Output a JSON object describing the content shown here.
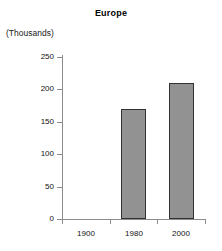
{
  "chart_data": {
    "type": "bar",
    "title": "Europe",
    "xlabel": "",
    "ylabel": "(Thousands)",
    "categories": [
      "1900",
      "1980",
      "2000"
    ],
    "values": [
      0,
      170,
      210
    ],
    "series": [
      {
        "name": "Europe",
        "values": [
          0,
          170,
          210
        ]
      }
    ],
    "ylim": [
      0,
      250
    ],
    "yticks": [
      0,
      50,
      100,
      150,
      200,
      250
    ],
    "ytick_labels": [
      "0",
      "50",
      "100",
      "150",
      "200",
      "250"
    ],
    "grid": false,
    "legend": false,
    "bar_fill_color": "#929292",
    "bar_border_color": "#333333",
    "axis_color": "#8c8c8c",
    "background_color": "#ffffff"
  }
}
